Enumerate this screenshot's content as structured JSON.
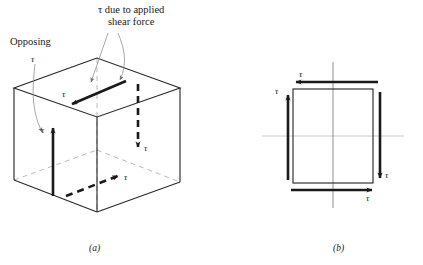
{
  "figure": {
    "title_annotation": "τ due to applied\nshear force",
    "annotation_line1": "τ due to applied",
    "annotation_line2": "shear force",
    "opposing_label": "Opposing",
    "tau_symbol": "τ",
    "caption_a": "(a)",
    "caption_b": "(b)",
    "colors": {
      "ink": "#1a1a1a",
      "outline": "#2b2b2b",
      "hidden_edge": "#9a9a9a",
      "axis": "#b5b5b5",
      "leader": "#8a8a8a",
      "background": "#ffffff"
    }
  },
  "panel_a": {
    "name": "isometric-cube-shear",
    "labels": {
      "top_face_tau": "τ",
      "left_face_tau": "τ",
      "right_face_tau": "τ",
      "bottom_face_tau": "τ",
      "opposing_tau": "τ"
    },
    "arrows": [
      {
        "id": "top-face-arrow",
        "style": "solid",
        "direction": "down-left",
        "label": "τ"
      },
      {
        "id": "left-face-arrow",
        "style": "solid",
        "direction": "up",
        "label": "τ"
      },
      {
        "id": "right-face-arrow",
        "style": "dashed",
        "direction": "down",
        "label": "τ"
      },
      {
        "id": "bottom-face-arrow",
        "style": "dashed",
        "direction": "up-right",
        "label": "τ"
      }
    ]
  },
  "panel_b": {
    "name": "square-complementary-shear",
    "arrows": [
      {
        "id": "top-edge-arrow",
        "direction": "left",
        "label": "τ"
      },
      {
        "id": "right-edge-arrow",
        "direction": "down",
        "label": "τ"
      },
      {
        "id": "bottom-edge-arrow",
        "direction": "right",
        "label": "τ"
      },
      {
        "id": "left-edge-arrow",
        "direction": "up",
        "label": "τ"
      }
    ],
    "labels": {
      "top_tau": "τ",
      "right_tau": "τ",
      "bottom_tau": "τ",
      "left_tau": "τ"
    }
  }
}
